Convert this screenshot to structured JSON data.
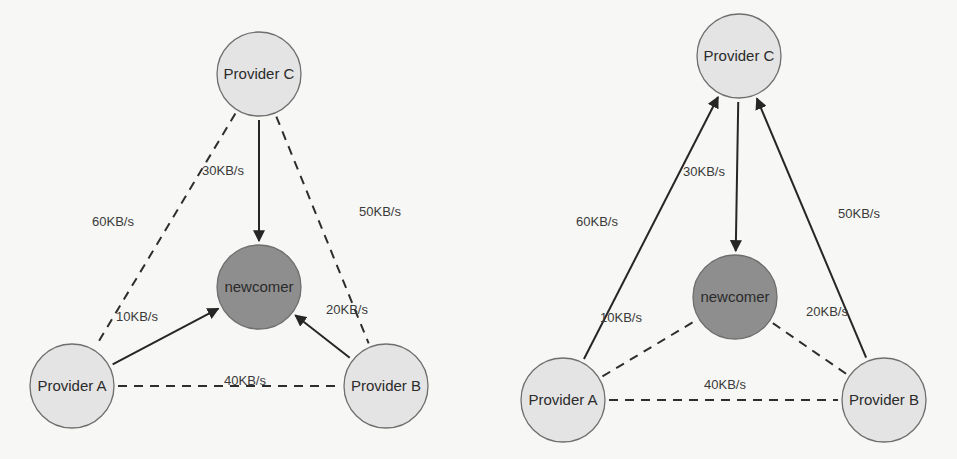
{
  "colors": {
    "background": "#f7f7f5",
    "provider_fill": "#e4e4e4",
    "newcomer_fill": "#8e8e8e",
    "node_stroke": "#6e6e6e",
    "edge_color": "#262626",
    "text_color": "#2b2b2b"
  },
  "diagrams": [
    {
      "id": "left",
      "nodes": [
        {
          "id": "C",
          "label": "Provider C",
          "kind": "provider",
          "cx": 259,
          "cy": 74,
          "r": 42
        },
        {
          "id": "N",
          "label": "newcomer",
          "kind": "newcomer",
          "cx": 259,
          "cy": 287,
          "r": 42
        },
        {
          "id": "A",
          "label": "Provider A",
          "kind": "provider",
          "cx": 72,
          "cy": 386,
          "r": 42
        },
        {
          "id": "B",
          "label": "Provider B",
          "kind": "provider",
          "cx": 386,
          "cy": 386,
          "r": 42
        }
      ],
      "edges": [
        {
          "from": "C",
          "to": "N",
          "style": "solid",
          "arrow": true,
          "label": "30KB/s",
          "lx": 202,
          "ly": 175
        },
        {
          "from": "A",
          "to": "N",
          "style": "solid",
          "arrow": true,
          "label": "10KB/s",
          "lx": 116,
          "ly": 321
        },
        {
          "from": "B",
          "to": "N",
          "style": "solid",
          "arrow": true,
          "label": "20KB/s",
          "lx": 326,
          "ly": 314
        },
        {
          "from": "C",
          "to": "A",
          "style": "dashed",
          "arrow": false,
          "label": "60KB/s",
          "lx": 92,
          "ly": 226
        },
        {
          "from": "C",
          "to": "B",
          "style": "dashed",
          "arrow": false,
          "label": "50KB/s",
          "lx": 359,
          "ly": 216
        },
        {
          "from": "A",
          "to": "B",
          "style": "dashed",
          "arrow": false,
          "label": "40KB/s",
          "lx": 224,
          "ly": 385
        }
      ]
    },
    {
      "id": "right",
      "nodes": [
        {
          "id": "C",
          "label": "Provider C",
          "kind": "provider",
          "cx": 739,
          "cy": 56,
          "r": 42
        },
        {
          "id": "N",
          "label": "newcomer",
          "kind": "newcomer",
          "cx": 735,
          "cy": 297,
          "r": 42
        },
        {
          "id": "A",
          "label": "Provider A",
          "kind": "provider",
          "cx": 563,
          "cy": 400,
          "r": 42
        },
        {
          "id": "B",
          "label": "Provider B",
          "kind": "provider",
          "cx": 884,
          "cy": 400,
          "r": 42
        }
      ],
      "edges": [
        {
          "from": "C",
          "to": "N",
          "style": "solid",
          "arrow": true,
          "label": "30KB/s",
          "lx": 683,
          "ly": 176
        },
        {
          "from": "A",
          "to": "C",
          "style": "solid",
          "arrow": true,
          "label": "60KB/s",
          "lx": 576,
          "ly": 226
        },
        {
          "from": "B",
          "to": "C",
          "style": "solid",
          "arrow": true,
          "label": "50KB/s",
          "lx": 838,
          "ly": 218
        },
        {
          "from": "A",
          "to": "N",
          "style": "dashed",
          "arrow": false,
          "label": "10KB/s",
          "lx": 600,
          "ly": 322
        },
        {
          "from": "N",
          "to": "B",
          "style": "dashed",
          "arrow": false,
          "label": "20KB/s",
          "lx": 806,
          "ly": 316
        },
        {
          "from": "A",
          "to": "B",
          "style": "dashed",
          "arrow": false,
          "label": "40KB/s",
          "lx": 704,
          "ly": 389
        }
      ]
    }
  ]
}
